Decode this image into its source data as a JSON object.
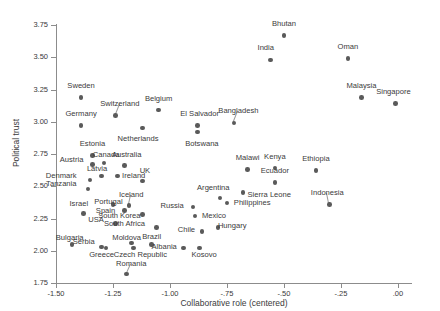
{
  "chart_data": {
    "type": "scatter",
    "title": "",
    "xlabel": "Collaborative role (centered)",
    "ylabel": "Political trust",
    "xlim": [
      -1.5,
      0.05
    ],
    "ylim": [
      1.75,
      3.75
    ],
    "xticks": [
      -1.5,
      -1.25,
      -1.0,
      -0.75,
      -0.5,
      -0.25,
      0.0
    ],
    "xtick_labels": [
      "-1.50",
      "-1.25",
      "-1.00",
      "-.75",
      "-.50",
      "-.25",
      ".00"
    ],
    "yticks": [
      1.75,
      2.0,
      2.25,
      2.5,
      2.75,
      3.0,
      3.25,
      3.5,
      3.75
    ],
    "ytick_labels": [
      "1.75",
      "2.00",
      "2.25",
      "2.50",
      "2.75",
      "3.00",
      "3.25",
      "3.50",
      "3.75"
    ],
    "grid": false,
    "legend": false,
    "point_color": "#5a5a5a",
    "axis_color": "#8c8c8c",
    "points": [
      {
        "label": "Bhutan",
        "x": -0.5,
        "y": 3.67,
        "lx": -0.5,
        "ly": 3.76,
        "lpos": "above"
      },
      {
        "label": "India",
        "x": -0.56,
        "y": 3.48,
        "lx": -0.58,
        "ly": 3.57,
        "lpos": "above"
      },
      {
        "label": "Oman",
        "x": -0.22,
        "y": 3.49,
        "lx": -0.22,
        "ly": 3.58,
        "lpos": "above"
      },
      {
        "label": "Sweden",
        "x": -1.39,
        "y": 3.19,
        "lx": -1.39,
        "ly": 3.28,
        "lpos": "above"
      },
      {
        "label": "Switzerland",
        "x": -1.24,
        "y": 3.05,
        "lx": -1.22,
        "ly": 3.14,
        "lpos": "above",
        "leader": true
      },
      {
        "label": "Belgium",
        "x": -1.05,
        "y": 3.09,
        "lx": -1.05,
        "ly": 3.18,
        "lpos": "above"
      },
      {
        "label": "Malaysia",
        "x": -0.16,
        "y": 3.19,
        "lx": -0.16,
        "ly": 3.28,
        "lpos": "above"
      },
      {
        "label": "Singapore",
        "x": -0.01,
        "y": 3.14,
        "lx": -0.02,
        "ly": 3.23,
        "lpos": "above"
      },
      {
        "label": "Germany",
        "x": -1.39,
        "y": 2.97,
        "lx": -1.39,
        "ly": 3.06,
        "lpos": "above"
      },
      {
        "label": "El Salvador",
        "x": -0.88,
        "y": 2.97,
        "lx": -0.87,
        "ly": 3.06,
        "lpos": "above"
      },
      {
        "label": "Bangladesh",
        "x": -0.72,
        "y": 2.99,
        "lx": -0.7,
        "ly": 3.08,
        "lpos": "above",
        "leader": true
      },
      {
        "label": "Netherlands",
        "x": -1.12,
        "y": 2.95,
        "lx": -1.14,
        "ly": 2.87,
        "lpos": "below"
      },
      {
        "label": "Botswana",
        "x": -0.88,
        "y": 2.92,
        "lx": -0.86,
        "ly": 2.83,
        "lpos": "below"
      },
      {
        "label": "Estonia",
        "x": -1.34,
        "y": 2.74,
        "lx": -1.34,
        "ly": 2.83,
        "lpos": "above"
      },
      {
        "label": "Malawi",
        "x": -0.66,
        "y": 2.63,
        "lx": -0.66,
        "ly": 2.72,
        "lpos": "above"
      },
      {
        "label": "Kenya",
        "x": -0.54,
        "y": 2.64,
        "lx": -0.54,
        "ly": 2.73,
        "lpos": "above"
      },
      {
        "label": "Ethiopia",
        "x": -0.36,
        "y": 2.62,
        "lx": -0.36,
        "ly": 2.71,
        "lpos": "above"
      },
      {
        "label": "Austria",
        "x": -1.34,
        "y": 2.67,
        "lx": -1.38,
        "ly": 2.7,
        "lpos": "left"
      },
      {
        "label": "Canada",
        "x": -1.29,
        "y": 2.68,
        "lx": -1.28,
        "ly": 2.74,
        "lpos": "above"
      },
      {
        "label": "Australia",
        "x": -1.2,
        "y": 2.66,
        "lx": -1.19,
        "ly": 2.74,
        "lpos": "above"
      },
      {
        "label": "Latvia",
        "x": -1.3,
        "y": 2.58,
        "lx": -1.32,
        "ly": 2.63,
        "lpos": "above"
      },
      {
        "label": "Ireland",
        "x": -1.23,
        "y": 2.58,
        "lx": -1.21,
        "ly": 2.58,
        "lpos": "right"
      },
      {
        "label": "UK",
        "x": -1.12,
        "y": 2.54,
        "lx": -1.11,
        "ly": 2.62,
        "lpos": "above"
      },
      {
        "label": "Denmark",
        "x": -1.35,
        "y": 2.55,
        "lx": -1.41,
        "ly": 2.58,
        "lpos": "left"
      },
      {
        "label": "Ecuador",
        "x": -0.54,
        "y": 2.53,
        "lx": -0.54,
        "ly": 2.62,
        "lpos": "above"
      },
      {
        "label": "Tanzania",
        "x": -1.36,
        "y": 2.48,
        "lx": -1.41,
        "ly": 2.52,
        "lpos": "left"
      },
      {
        "label": "Argentina",
        "x": -0.78,
        "y": 2.41,
        "lx": -0.81,
        "ly": 2.49,
        "lpos": "above"
      },
      {
        "label": "Sierra Leone",
        "x": -0.68,
        "y": 2.45,
        "lx": -0.66,
        "ly": 2.43,
        "lpos": "right"
      },
      {
        "label": "Iceland",
        "x": -1.18,
        "y": 2.35,
        "lx": -1.17,
        "ly": 2.43,
        "lpos": "above",
        "leader": true
      },
      {
        "label": "Israel",
        "x": -1.38,
        "y": 2.29,
        "lx": -1.4,
        "ly": 2.36,
        "lpos": "above"
      },
      {
        "label": "Portugal",
        "x": -1.25,
        "y": 2.36,
        "lx": -1.27,
        "ly": 2.38,
        "lpos": "above"
      },
      {
        "label": "Russia",
        "x": -0.9,
        "y": 2.34,
        "lx": -0.94,
        "ly": 2.35,
        "lpos": "left"
      },
      {
        "label": "Philippines",
        "x": -0.75,
        "y": 2.37,
        "lx": -0.72,
        "ly": 2.37,
        "lpos": "right"
      },
      {
        "label": "Spain",
        "x": -1.2,
        "y": 2.31,
        "lx": -1.24,
        "ly": 2.31,
        "lpos": "left"
      },
      {
        "label": "South Korea",
        "x": -1.12,
        "y": 2.28,
        "lx": -1.13,
        "ly": 2.27,
        "lpos": "left"
      },
      {
        "label": "Mexico",
        "x": -0.89,
        "y": 2.27,
        "lx": -0.86,
        "ly": 2.27,
        "lpos": "right"
      },
      {
        "label": "USA",
        "x": -1.24,
        "y": 2.21,
        "lx": -1.29,
        "ly": 2.24,
        "lpos": "left"
      },
      {
        "label": "South Africa",
        "x": -1.06,
        "y": 2.18,
        "lx": -1.11,
        "ly": 2.21,
        "lpos": "left"
      },
      {
        "label": "Chile",
        "x": -0.86,
        "y": 2.15,
        "lx": -0.89,
        "ly": 2.16,
        "lpos": "left"
      },
      {
        "label": "Hungary",
        "x": -0.79,
        "y": 2.18,
        "lx": -0.79,
        "ly": 2.19,
        "lpos": "right"
      },
      {
        "label": "Indonesia",
        "x": -0.3,
        "y": 2.36,
        "lx": -0.31,
        "ly": 2.45,
        "lpos": "above",
        "leader": true
      },
      {
        "label": "Bulgaria",
        "x": -1.43,
        "y": 2.05,
        "lx": -1.44,
        "ly": 2.1,
        "lpos": "above"
      },
      {
        "label": "Serbia",
        "x": -1.3,
        "y": 2.03,
        "lx": -1.33,
        "ly": 2.07,
        "lpos": "left"
      },
      {
        "label": "Moldova",
        "x": -1.17,
        "y": 2.06,
        "lx": -1.19,
        "ly": 2.1,
        "lpos": "above"
      },
      {
        "label": "Brazil",
        "x": -1.08,
        "y": 2.05,
        "lx": -1.08,
        "ly": 2.11,
        "lpos": "above"
      },
      {
        "label": "Albania",
        "x": -0.94,
        "y": 2.02,
        "lx": -0.97,
        "ly": 2.03,
        "lpos": "left"
      },
      {
        "label": "Kosovo",
        "x": -0.87,
        "y": 2.02,
        "lx": -0.85,
        "ly": 1.97,
        "lpos": "below"
      },
      {
        "label": "Greece",
        "x": -1.28,
        "y": 2.02,
        "lx": -1.3,
        "ly": 1.97,
        "lpos": "below"
      },
      {
        "label": "Czech Republic",
        "x": -1.16,
        "y": 2.02,
        "lx": -1.13,
        "ly": 1.97,
        "lpos": "below"
      },
      {
        "label": "Romania",
        "x": -1.19,
        "y": 1.82,
        "lx": -1.17,
        "ly": 1.9,
        "lpos": "above",
        "leader": true
      }
    ]
  }
}
